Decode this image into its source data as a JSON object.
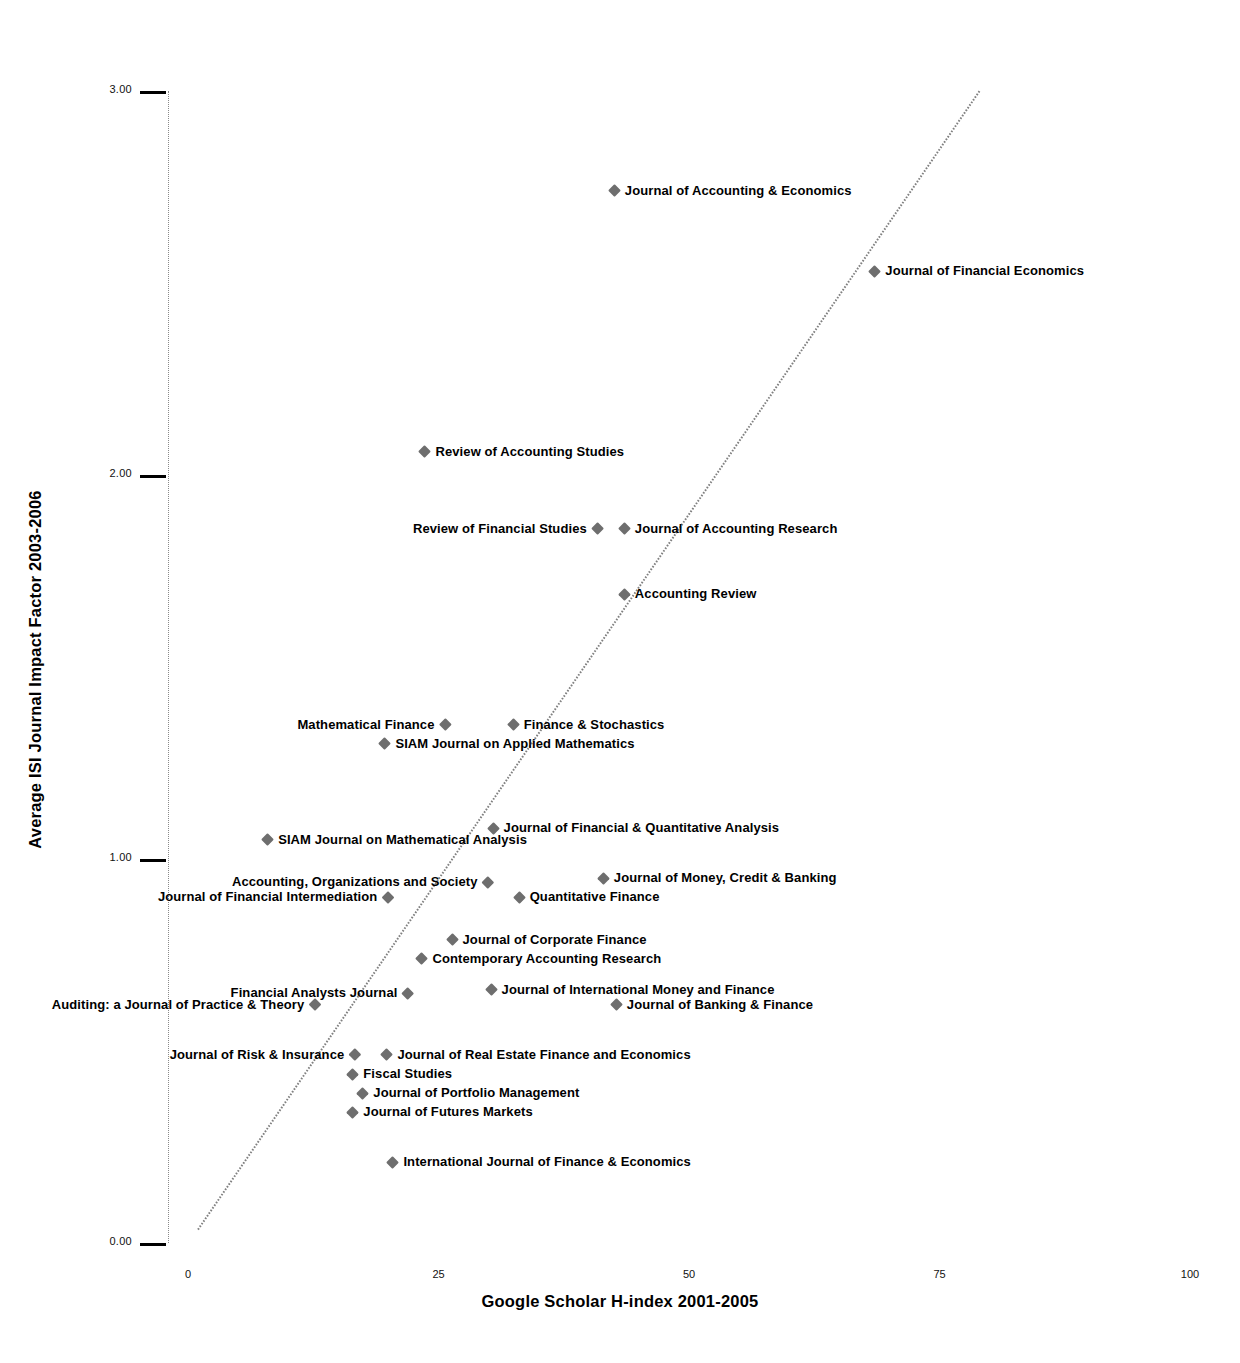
{
  "chart_data": {
    "type": "scatter",
    "title": "",
    "xlabel": "Google Scholar H-index 2001-2005",
    "ylabel": "Average ISI Journal Impact Factor 2003-2006",
    "xlim": [
      0,
      100
    ],
    "ylim": [
      0.0,
      3.0
    ],
    "xticks": [
      "0",
      "25",
      "50",
      "75",
      "100"
    ],
    "xtick_values": [
      0,
      25,
      50,
      75,
      100
    ],
    "yticks": [
      "0.00",
      "1.00",
      "2.00",
      "3.00"
    ],
    "ytick_values": [
      0.0,
      1.0,
      2.0,
      3.0
    ],
    "grid": false,
    "legend": "none",
    "trendline": {
      "type": "linear",
      "x_start": 1.0,
      "y_start": 0.035,
      "x_end": 79.0,
      "y_end": 3.0,
      "color": "#808080",
      "style": "dotted"
    },
    "marker_color": "#6e6e6e",
    "marker_shape": "diamond",
    "points": [
      {
        "label": "Journal of Accounting & Economics",
        "x": 42.1,
        "y": 2.74,
        "label_side": "right"
      },
      {
        "label": "Journal of Financial Economics",
        "x": 68.1,
        "y": 2.53,
        "label_side": "right"
      },
      {
        "label": "Review of Accounting Studies",
        "x": 23.2,
        "y": 2.06,
        "label_side": "right"
      },
      {
        "label": "Review of Financial Studies",
        "x": 41.3,
        "y": 1.86,
        "label_side": "left"
      },
      {
        "label": "Journal of Accounting Research",
        "x": 43.1,
        "y": 1.86,
        "label_side": "right"
      },
      {
        "label": "Accounting Review",
        "x": 43.1,
        "y": 1.69,
        "label_side": "right"
      },
      {
        "label": "Mathematical Finance",
        "x": 26.1,
        "y": 1.35,
        "label_side": "left"
      },
      {
        "label": "Finance & Stochastics",
        "x": 32.0,
        "y": 1.35,
        "label_side": "right"
      },
      {
        "label": "SIAM Journal on Applied Mathematics",
        "x": 19.2,
        "y": 1.3,
        "label_side": "right"
      },
      {
        "label": "Journal of Financial & Quantitative Analysis",
        "x": 30.0,
        "y": 1.08,
        "label_side": "right"
      },
      {
        "label": "SIAM Journal on Mathematical Analysis",
        "x": 7.5,
        "y": 1.05,
        "label_side": "right"
      },
      {
        "label": "Journal of Money, Credit & Banking",
        "x": 41.0,
        "y": 0.95,
        "label_side": "right"
      },
      {
        "label": "Accounting, Organizations and Society",
        "x": 30.4,
        "y": 0.94,
        "label_side": "left"
      },
      {
        "label": "Journal of Financial Intermediation",
        "x": 20.4,
        "y": 0.9,
        "label_side": "left"
      },
      {
        "label": "Quantitative Finance",
        "x": 32.6,
        "y": 0.9,
        "label_side": "right"
      },
      {
        "label": "Journal of Corporate Finance",
        "x": 25.9,
        "y": 0.79,
        "label_side": "right"
      },
      {
        "label": "Contemporary Accounting Research",
        "x": 22.9,
        "y": 0.74,
        "label_side": "right"
      },
      {
        "label": "Financial Analysts Journal",
        "x": 22.4,
        "y": 0.65,
        "label_side": "left"
      },
      {
        "label": "Journal of International Money and Finance",
        "x": 29.8,
        "y": 0.66,
        "label_side": "right"
      },
      {
        "label": "Auditing: a Journal of Practice & Theory",
        "x": 13.1,
        "y": 0.62,
        "label_side": "left"
      },
      {
        "label": "Journal of Banking & Finance",
        "x": 42.3,
        "y": 0.62,
        "label_side": "right"
      },
      {
        "label": "Journal of Risk & Insurance",
        "x": 17.1,
        "y": 0.49,
        "label_side": "left"
      },
      {
        "label": "Journal of Real Estate Finance and Economics",
        "x": 19.4,
        "y": 0.49,
        "label_side": "right"
      },
      {
        "label": "Fiscal Studies",
        "x": 16.0,
        "y": 0.44,
        "label_side": "right"
      },
      {
        "label": "Journal of Portfolio Management",
        "x": 17.0,
        "y": 0.39,
        "label_side": "right"
      },
      {
        "label": "Journal of Futures Markets",
        "x": 16.0,
        "y": 0.34,
        "label_side": "right"
      },
      {
        "label": "International Journal of Finance & Economics",
        "x": 20.0,
        "y": 0.21,
        "label_side": "right"
      }
    ]
  }
}
